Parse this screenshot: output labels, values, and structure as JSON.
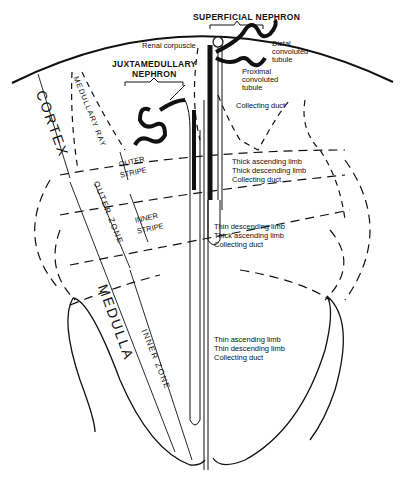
{
  "diagram": {
    "nephron_titles": {
      "superficial": "SUPERFICIAL  NEPHRON",
      "juxtamedullary_line1": "JUXTAMEDULLARY",
      "juxtamedullary_line2": "NEPHRON"
    },
    "region_labels": {
      "cortex": "CORTEX",
      "medulla": "MEDULLA",
      "medullary_ray": "MEDULLARY  RAY",
      "outer_zone": "OUTER  ZONE",
      "inner_zone": "INNER  ZONE",
      "outer_stripe_line1": "OUTER",
      "outer_stripe_line2": "STRIPE",
      "inner_stripe_line1": "INNER",
      "inner_stripe_line2": "STRIPE"
    },
    "structure_labels": [
      {
        "text": "Renal corpuscle",
        "x": 142,
        "y": 42
      },
      {
        "text": "Distal",
        "x": 272,
        "y": 40
      },
      {
        "text": "convoluted",
        "x": 272,
        "y": 48
      },
      {
        "text": "tubule",
        "x": 272,
        "y": 56
      },
      {
        "text": "Proximal",
        "x": 242,
        "y": 68
      },
      {
        "text": "convoluted",
        "x": 242,
        "y": 76
      },
      {
        "text": "tubule",
        "x": 242,
        "y": 84
      },
      {
        "text": "Collecting duct",
        "x": 236,
        "y": 102
      },
      {
        "text": "Thick ascending limb",
        "x": 232,
        "y": 158
      },
      {
        "text": "Thick descending limb",
        "x": 232,
        "y": 167
      },
      {
        "text": "Collecting duct",
        "x": 232,
        "y": 176
      },
      {
        "text": "Thin descending limb",
        "x": 214,
        "y": 223
      },
      {
        "text": "Thick ascending limb",
        "x": 214,
        "y": 232
      },
      {
        "text": "Collecting duct",
        "x": 214,
        "y": 241
      },
      {
        "text": "Thin ascending limb",
        "x": 214,
        "y": 336
      },
      {
        "text": "Thin descending limb",
        "x": 214,
        "y": 345
      },
      {
        "text": "Collecting duct",
        "x": 214,
        "y": 354
      }
    ],
    "colors": {
      "ink": "#111111",
      "background": "#ffffff"
    }
  }
}
